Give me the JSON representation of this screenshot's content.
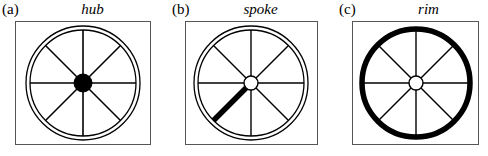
{
  "figure": {
    "caption_style": "three-panel wagon wheel diagram",
    "background_color": "#ffffff",
    "stroke_color": "#000000",
    "frame_color": "#555555",
    "highlight_color": "#000000"
  },
  "panels": [
    {
      "letter": "(a)",
      "title": "hub",
      "highlight": "hub",
      "hub_fill": "#000000",
      "hub_radius": 9,
      "rim_style": "double-thin",
      "rim_width": 1,
      "spoke_count": 8,
      "thick_spoke_angle_deg": null
    },
    {
      "letter": "(b)",
      "title": "spoke",
      "highlight": "spoke",
      "hub_fill": "#ffffff",
      "hub_radius": 7,
      "rim_style": "double-thin",
      "rim_width": 1,
      "spoke_count": 8,
      "thick_spoke_angle_deg": 225
    },
    {
      "letter": "(c)",
      "title": "rim",
      "highlight": "rim",
      "hub_fill": "#ffffff",
      "hub_radius": 7,
      "rim_style": "single-thick",
      "rim_width": 5,
      "spoke_count": 8,
      "thick_spoke_angle_deg": null
    }
  ]
}
